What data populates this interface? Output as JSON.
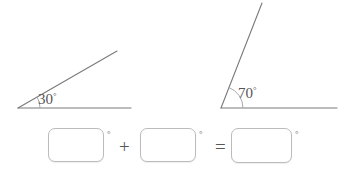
{
  "page": {
    "background_color": "#ffffff",
    "stroke_color": "#7a7a7a",
    "text_color": "#565656",
    "box_border_color": "#bcbcbc"
  },
  "figures": [
    {
      "id": "angle-figure-1",
      "label_value": "30",
      "degree_symbol": "°",
      "measure_degrees": 30,
      "vertex": {
        "x": 18,
        "y": 108
      },
      "baseline_end": {
        "x": 131,
        "y": 108
      },
      "ray_end": {
        "x": 117,
        "y": 51
      },
      "arc_radius": 22
    },
    {
      "id": "angle-figure-2",
      "label_value": "70",
      "degree_symbol": "°",
      "measure_degrees": 70,
      "vertex": {
        "x": 221,
        "y": 108
      },
      "baseline_end": {
        "x": 337,
        "y": 108
      },
      "ray_end": {
        "x": 262,
        "y": 3
      },
      "arc_radius": 22
    }
  ],
  "equation": {
    "cells": [
      {
        "id": "answer-box-1",
        "value": "",
        "placeholder": "",
        "degree_symbol": "°"
      },
      {
        "id": "answer-box-2",
        "value": "",
        "placeholder": "",
        "degree_symbol": "°"
      },
      {
        "id": "answer-box-3",
        "value": "",
        "placeholder": "",
        "degree_symbol": "°"
      }
    ],
    "operator_plus": "+",
    "operator_equals": "="
  }
}
